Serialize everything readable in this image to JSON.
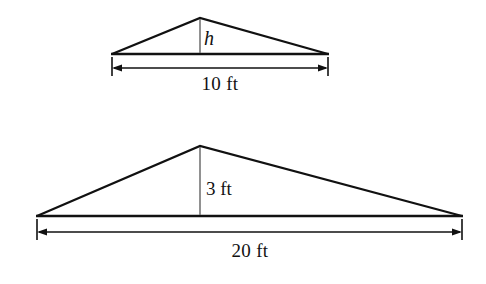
{
  "figure": {
    "background_color": "#ffffff",
    "stroke_color": "#111111",
    "height_line_color": "#6d6d6d",
    "shapes": [
      {
        "name": "small-triangle",
        "type": "triangle",
        "vertices": {
          "left": [
            112,
            54
          ],
          "apex": [
            200,
            18
          ],
          "right": [
            328,
            54
          ]
        },
        "base_length_label": "10 ft",
        "base_length_value": 10,
        "base_units": "ft",
        "height_label": "h",
        "height_value": null,
        "height_known": false
      },
      {
        "name": "large-triangle",
        "type": "triangle",
        "vertices": {
          "left": [
            37,
            216
          ],
          "apex": [
            200,
            146
          ],
          "right": [
            462,
            216
          ]
        },
        "base_length_label": "20 ft",
        "base_length_value": 20,
        "base_units": "ft",
        "height_label": "3 ft",
        "height_value": 3,
        "height_units": "ft",
        "height_known": true
      }
    ],
    "labels": {
      "small_height": "h",
      "small_base": "10 ft",
      "large_height": "3 ft",
      "large_base": "20 ft"
    }
  }
}
